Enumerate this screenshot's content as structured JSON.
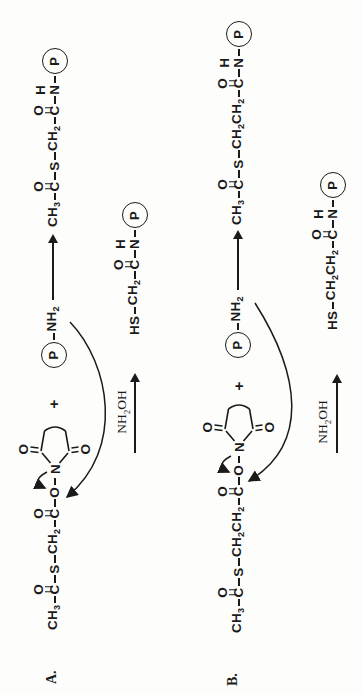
{
  "colors": {
    "ink": "#1a1a1a",
    "paper": "#fdfdfc"
  },
  "schemes": [
    {
      "label": "A.",
      "plus": "+",
      "ring": {
        "o_top": "O",
        "n": "N",
        "o_bottom": "O"
      },
      "reactant": [
        {
          "a": [
            {
              "t": "CH"
            },
            {
              "s": "3"
            }
          ]
        },
        {
          "b": 1
        },
        {
          "a": [
            {
              "t": "C"
            }
          ],
          "ab": "O"
        },
        {
          "b": 1
        },
        {
          "a": [
            {
              "t": "S"
            }
          ]
        },
        {
          "b": 1
        },
        {
          "a": [
            {
              "t": "CH"
            },
            {
              "s": "2"
            }
          ]
        },
        {
          "b": 1
        },
        {
          "a": [
            {
              "t": "C"
            }
          ],
          "ab": "O"
        },
        {
          "b": 1
        },
        {
          "a": [
            {
              "t": "O"
            }
          ]
        },
        {
          "b": 1
        },
        {
          "ring": 1
        }
      ],
      "amine": [
        {
          "p": "P"
        },
        {
          "b": 1
        },
        {
          "a": [
            {
              "t": "NH"
            },
            {
              "s": "2"
            }
          ]
        }
      ],
      "product1": [
        {
          "a": [
            {
              "t": "CH"
            },
            {
              "s": "3"
            }
          ]
        },
        {
          "b": 1
        },
        {
          "a": [
            {
              "t": "C"
            }
          ],
          "ab": "O"
        },
        {
          "b": 1
        },
        {
          "a": [
            {
              "t": "S"
            }
          ]
        },
        {
          "b": 1
        },
        {
          "a": [
            {
              "t": "CH"
            },
            {
              "s": "2"
            }
          ]
        },
        {
          "b": 1
        },
        {
          "a": [
            {
              "t": "C"
            }
          ],
          "ab": "O"
        },
        {
          "b": 1
        },
        {
          "a": [
            {
              "t": "N"
            }
          ],
          "ab": "H"
        },
        {
          "b": 1
        },
        {
          "p": "P"
        }
      ],
      "reagent": [
        {
          "t": "NH"
        },
        {
          "s": "2"
        },
        {
          "t": "OH"
        }
      ],
      "product2": [
        {
          "a": [
            {
              "t": "HS"
            }
          ]
        },
        {
          "b": 1
        },
        {
          "a": [
            {
              "t": "CH"
            },
            {
              "s": "2"
            }
          ]
        },
        {
          "b": 1
        },
        {
          "a": [
            {
              "t": "C"
            }
          ],
          "ab": "O"
        },
        {
          "b": 1
        },
        {
          "a": [
            {
              "t": "N"
            }
          ],
          "ab": "H"
        },
        {
          "b": 1
        },
        {
          "p": "P"
        }
      ]
    },
    {
      "label": "B.",
      "plus": "+",
      "ring": {
        "o_top": "O",
        "n": "N",
        "o_bottom": "O"
      },
      "reactant": [
        {
          "a": [
            {
              "t": "CH"
            },
            {
              "s": "3"
            }
          ]
        },
        {
          "b": 1
        },
        {
          "a": [
            {
              "t": "C"
            }
          ],
          "ab": "O"
        },
        {
          "b": 1
        },
        {
          "a": [
            {
              "t": "S"
            }
          ]
        },
        {
          "b": 1
        },
        {
          "a": [
            {
              "t": "CH"
            },
            {
              "s": "2"
            },
            {
              "t": "CH"
            },
            {
              "s": "2"
            }
          ]
        },
        {
          "b": 1
        },
        {
          "a": [
            {
              "t": "C"
            }
          ],
          "ab": "O"
        },
        {
          "b": 1
        },
        {
          "a": [
            {
              "t": "O"
            }
          ]
        },
        {
          "b": 1
        },
        {
          "ring": 1
        }
      ],
      "amine": [
        {
          "p": "P"
        },
        {
          "b": 1
        },
        {
          "a": [
            {
              "t": "NH"
            },
            {
              "s": "2"
            }
          ]
        }
      ],
      "product1": [
        {
          "a": [
            {
              "t": "CH"
            },
            {
              "s": "3"
            }
          ]
        },
        {
          "b": 1
        },
        {
          "a": [
            {
              "t": "C"
            }
          ],
          "ab": "O"
        },
        {
          "b": 1
        },
        {
          "a": [
            {
              "t": "S"
            }
          ]
        },
        {
          "b": 1
        },
        {
          "a": [
            {
              "t": "CH"
            },
            {
              "s": "2"
            },
            {
              "t": "CH"
            },
            {
              "s": "2"
            }
          ]
        },
        {
          "b": 1
        },
        {
          "a": [
            {
              "t": "C"
            }
          ],
          "ab": "O"
        },
        {
          "b": 1
        },
        {
          "a": [
            {
              "t": "N"
            }
          ],
          "ab": "H"
        },
        {
          "b": 1
        },
        {
          "p": "P"
        }
      ],
      "reagent": [
        {
          "t": "NH"
        },
        {
          "s": "2"
        },
        {
          "t": "OH"
        }
      ],
      "product2": [
        {
          "a": [
            {
              "t": "HS"
            }
          ]
        },
        {
          "b": 1
        },
        {
          "a": [
            {
              "t": "CH"
            },
            {
              "s": "2"
            },
            {
              "t": "CH"
            },
            {
              "s": "2"
            }
          ]
        },
        {
          "b": 1
        },
        {
          "a": [
            {
              "t": "C"
            }
          ],
          "ab": "O"
        },
        {
          "b": 1
        },
        {
          "a": [
            {
              "t": "N"
            }
          ],
          "ab": "H"
        },
        {
          "b": 1
        },
        {
          "p": "P"
        }
      ]
    }
  ]
}
